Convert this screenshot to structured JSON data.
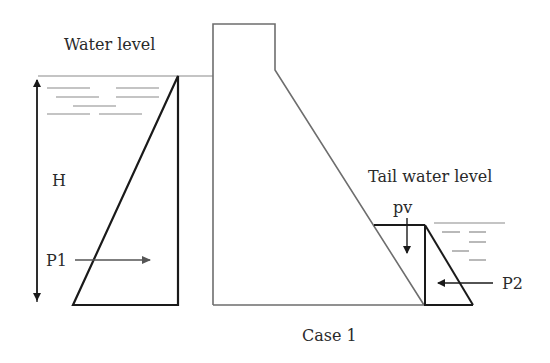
{
  "diagram": {
    "type": "gravity-dam-water-pressure",
    "caption": "Case 1",
    "labels": {
      "water_level": "Water level",
      "head": "H",
      "upstream_pressure": "P1",
      "tail_water_level": "Tail water level",
      "vertical_pressure": "pv",
      "downstream_pressure": "P2"
    },
    "colors": {
      "line": "#1a1a1a",
      "dam_outline": "#6e6e6e",
      "water_lines": "#8a8a8a",
      "text": "#2a2a2a",
      "background": "#ffffff"
    }
  }
}
